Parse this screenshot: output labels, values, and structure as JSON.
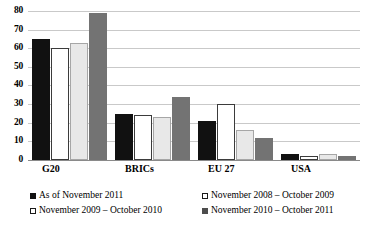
{
  "chart_data": {
    "type": "bar",
    "title": "",
    "subtitle": "",
    "xlabel": "",
    "ylabel": "",
    "ylim": [
      0,
      80
    ],
    "yticks": [
      0,
      10,
      20,
      30,
      40,
      50,
      60,
      70,
      80
    ],
    "ytick_labels": [
      "0",
      "10",
      "20",
      "30",
      "40",
      "50",
      "60",
      "70",
      "80"
    ],
    "grid": true,
    "legend_position": "bottom",
    "categories": [
      "G20",
      "BRICs",
      "EU 27",
      "USA"
    ],
    "series": [
      {
        "name": "As of November 2011",
        "color": "#111111",
        "values": [
          65,
          25,
          21,
          3
        ]
      },
      {
        "name": "November 2008 – October 2009",
        "color": "#ffffff",
        "values": [
          60,
          24,
          30,
          2
        ]
      },
      {
        "name": "November 2009 – October 2010",
        "color": "#e8e8e8",
        "values": [
          63,
          23,
          16,
          3
        ]
      },
      {
        "name": "November 2010 – October 2011",
        "color": "#737373",
        "values": [
          79,
          34,
          12,
          2
        ]
      }
    ]
  },
  "axis": {
    "ticks": [
      "80",
      "70",
      "60",
      "50",
      "40",
      "30",
      "20",
      "10",
      "0"
    ]
  },
  "categories": [
    {
      "label": "G20"
    },
    {
      "label": "BRICs"
    },
    {
      "label": "EU 27"
    },
    {
      "label": "USA"
    }
  ],
  "legend": {
    "items": [
      {
        "label": "As of November 2011"
      },
      {
        "label": "November 2008 – October 2009"
      },
      {
        "label": "November 2009 – October 2010"
      },
      {
        "label": "November 2010 – October 2011"
      }
    ]
  }
}
